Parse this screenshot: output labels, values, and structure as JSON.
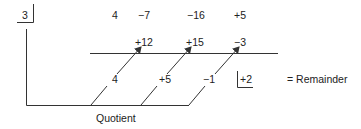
{
  "diagram": {
    "type": "synthetic-division",
    "divisor": "3",
    "coefficients": [
      "4",
      "−7",
      "−16",
      "+5"
    ],
    "products": [
      "+12",
      "+15",
      "−3"
    ],
    "quotient_values": [
      "4",
      "+5",
      "−1"
    ],
    "remainder_value": "+2",
    "remainder_label": "= Remainder",
    "quotient_label": "Quotient",
    "line_color": "#333333"
  }
}
